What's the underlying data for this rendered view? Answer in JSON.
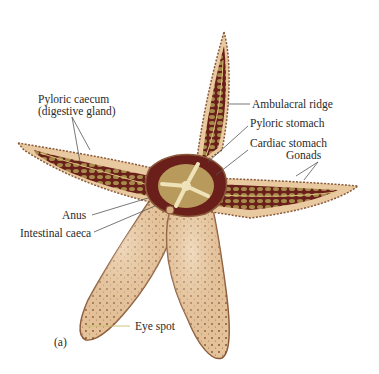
{
  "figure": {
    "panel_label": "(a)",
    "colors": {
      "skin": "#e9c9a0",
      "skin_border": "#8a5a3a",
      "interior": "#6b1f1a",
      "gland": "#b79a5a",
      "center": "#efe2b8",
      "leader_line": "#555555",
      "eye_spot_line": "#c8c070"
    },
    "labels": {
      "pyloric_caecum": "Pyloric caecum",
      "pyloric_caecum_sub": "(digestive gland)",
      "ambulacral_ridge": "Ambulacral ridge",
      "pyloric_stomach": "Pyloric stomach",
      "cardiac_stomach": "Cardiac stomach",
      "gonads": "Gonads",
      "anus": "Anus",
      "intestinal_caeca": "Intestinal caeca",
      "eye_spot": "Eye spot"
    }
  }
}
